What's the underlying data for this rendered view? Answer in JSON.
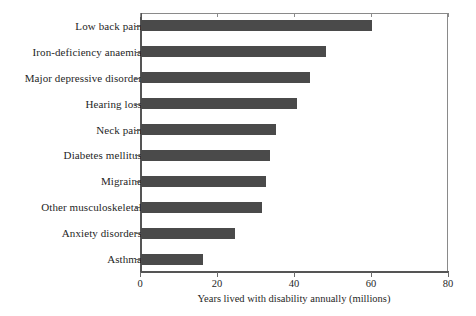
{
  "chart_data": {
    "type": "bar",
    "orientation": "horizontal",
    "title": "",
    "subtitle": "",
    "xlabel": "Years lived with disability annually (millions)",
    "ylabel": "",
    "categories": [
      "Low back pain",
      "Iron-deficiency anaemia",
      "Major depressive disorder",
      "Hearing loss",
      "Neck pain",
      "Diabetes mellitus",
      "Migraine",
      "Other musculoskeletal",
      "Anxiety disorders",
      "Asthma"
    ],
    "values": [
      60,
      48,
      44,
      40.5,
      35,
      33.5,
      32.5,
      31.5,
      24.5,
      16
    ],
    "xlim": [
      0,
      80
    ],
    "xticks": [
      0,
      20,
      40,
      60,
      80
    ],
    "xtick_labels": [
      "0",
      "20",
      "40",
      "60",
      "80"
    ],
    "grid": false,
    "legend": null,
    "bar_color": "#4a4a4a",
    "axis_color": "#555555",
    "background": "#ffffff"
  }
}
